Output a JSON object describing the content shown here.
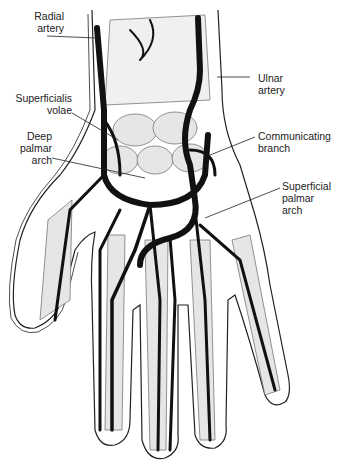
{
  "figure": {
    "colors": {
      "artery": "#111111",
      "bone_shade": "#bbbbbb",
      "outline": "#222222",
      "background": "#ffffff"
    }
  },
  "labels": [
    {
      "id": "radial-artery",
      "text": "Radial\nartery"
    },
    {
      "id": "ulnar-artery",
      "text": "Ulnar\nartery"
    },
    {
      "id": "superficialis-volae",
      "text": "Superficialis\nvolae"
    },
    {
      "id": "communicating-branch",
      "text": "Communicating\nbranch"
    },
    {
      "id": "deep-palmar-arch",
      "text": "Deep\npalmar\narch"
    },
    {
      "id": "superficial-palmar-arch",
      "text": "Superficial\npalmar\narch"
    }
  ]
}
